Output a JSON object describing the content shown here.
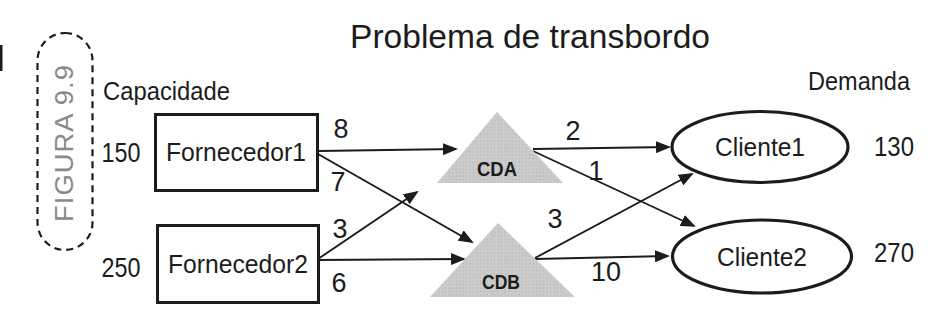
{
  "figure_badge": {
    "label": "FIGURA 9.9"
  },
  "title": "Problema de transbordo",
  "labels": {
    "capacity": "Capacidade",
    "demand": "Demanda"
  },
  "suppliers": [
    {
      "name": "Fornecedor1",
      "capacity": "150"
    },
    {
      "name": "Fornecedor2",
      "capacity": "250"
    }
  ],
  "hubs": [
    {
      "name": "CDA"
    },
    {
      "name": "CDB"
    }
  ],
  "clients": [
    {
      "name": "Cliente1",
      "demand": "130"
    },
    {
      "name": "Cliente2",
      "demand": "270"
    }
  ],
  "edges": [
    {
      "from": "Fornecedor1",
      "to": "CDA",
      "cost": "8"
    },
    {
      "from": "Fornecedor1",
      "to": "CDB",
      "cost": "7"
    },
    {
      "from": "Fornecedor2",
      "to": "CDA",
      "cost": "3"
    },
    {
      "from": "Fornecedor2",
      "to": "CDB",
      "cost": "6"
    },
    {
      "from": "CDA",
      "to": "Cliente1",
      "cost": "2"
    },
    {
      "from": "CDA",
      "to": "Cliente2",
      "cost": "1"
    },
    {
      "from": "CDB",
      "to": "Cliente1",
      "cost": "3"
    },
    {
      "from": "CDB",
      "to": "Cliente2",
      "cost": "10"
    }
  ],
  "colors": {
    "hub_fill": "#c9c9c9",
    "figure_label": "#8a8a8a",
    "ink": "#1c1c1c",
    "background": "#ffffff"
  }
}
